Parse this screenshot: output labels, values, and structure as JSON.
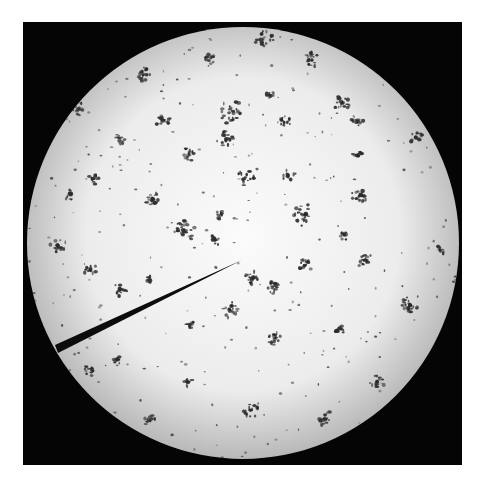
{
  "image": {
    "description": "Light microscope field of view showing scattered clusters of dark-stained bacteria (cocci in irregular clumps / short chains) on a bright background, with an eyepiece pointer line entering from the left.",
    "canvas": {
      "width": 483,
      "height": 485,
      "background": "#ffffff"
    },
    "frame": {
      "x": 23,
      "y": 22,
      "width": 439,
      "height": 443,
      "color": "#050505"
    },
    "field": {
      "cx": 243,
      "cy": 243,
      "r": 216,
      "center_color": "#fbfbfb",
      "mid_color": "#ececec",
      "edge_color": "#b8b8b8"
    },
    "pointer": {
      "label": "eyepiece pointer",
      "tip": [
        242,
        260
      ],
      "base_top": [
        55,
        345
      ],
      "base_bottom": [
        58,
        353
      ],
      "color": "#0c0c0c"
    },
    "cluster_color": "#2a2a2a",
    "speck_color": "#3a3a3a",
    "clusters": [
      {
        "x": 264,
        "y": 40,
        "r": 10
      },
      {
        "x": 231,
        "y": 112,
        "r": 12
      },
      {
        "x": 226,
        "y": 140,
        "r": 9
      },
      {
        "x": 163,
        "y": 121,
        "r": 8
      },
      {
        "x": 142,
        "y": 74,
        "r": 8
      },
      {
        "x": 210,
        "y": 60,
        "r": 6
      },
      {
        "x": 284,
        "y": 123,
        "r": 7
      },
      {
        "x": 312,
        "y": 60,
        "r": 8
      },
      {
        "x": 342,
        "y": 103,
        "r": 10
      },
      {
        "x": 357,
        "y": 122,
        "r": 7
      },
      {
        "x": 417,
        "y": 138,
        "r": 7
      },
      {
        "x": 357,
        "y": 155,
        "r": 6
      },
      {
        "x": 360,
        "y": 195,
        "r": 9
      },
      {
        "x": 304,
        "y": 215,
        "r": 11
      },
      {
        "x": 245,
        "y": 178,
        "r": 9
      },
      {
        "x": 288,
        "y": 175,
        "r": 7
      },
      {
        "x": 188,
        "y": 155,
        "r": 7
      },
      {
        "x": 220,
        "y": 215,
        "r": 5
      },
      {
        "x": 185,
        "y": 230,
        "r": 11
      },
      {
        "x": 153,
        "y": 200,
        "r": 8
      },
      {
        "x": 95,
        "y": 178,
        "r": 6
      },
      {
        "x": 70,
        "y": 195,
        "r": 6
      },
      {
        "x": 58,
        "y": 245,
        "r": 8
      },
      {
        "x": 90,
        "y": 270,
        "r": 7
      },
      {
        "x": 78,
        "y": 110,
        "r": 8
      },
      {
        "x": 252,
        "y": 278,
        "r": 9
      },
      {
        "x": 272,
        "y": 288,
        "r": 7
      },
      {
        "x": 305,
        "y": 265,
        "r": 7
      },
      {
        "x": 365,
        "y": 260,
        "r": 8
      },
      {
        "x": 410,
        "y": 305,
        "r": 10
      },
      {
        "x": 230,
        "y": 310,
        "r": 8
      },
      {
        "x": 275,
        "y": 338,
        "r": 8
      },
      {
        "x": 250,
        "y": 410,
        "r": 8
      },
      {
        "x": 325,
        "y": 418,
        "r": 8
      },
      {
        "x": 377,
        "y": 382,
        "r": 8
      },
      {
        "x": 90,
        "y": 370,
        "r": 6
      },
      {
        "x": 118,
        "y": 360,
        "r": 6
      },
      {
        "x": 120,
        "y": 290,
        "r": 7
      },
      {
        "x": 151,
        "y": 280,
        "r": 5
      },
      {
        "x": 190,
        "y": 325,
        "r": 5
      },
      {
        "x": 340,
        "y": 330,
        "r": 5
      },
      {
        "x": 345,
        "y": 235,
        "r": 5
      },
      {
        "x": 440,
        "y": 250,
        "r": 5
      },
      {
        "x": 150,
        "y": 420,
        "r": 6
      },
      {
        "x": 188,
        "y": 382,
        "r": 5
      },
      {
        "x": 215,
        "y": 240,
        "r": 6
      },
      {
        "x": 120,
        "y": 140,
        "r": 5
      },
      {
        "x": 270,
        "y": 95,
        "r": 5
      }
    ],
    "speck_seed": 7,
    "speck_count": 260
  }
}
